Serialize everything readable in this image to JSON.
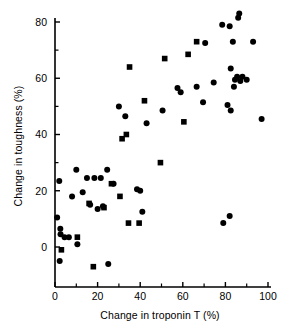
{
  "chart_data": {
    "type": "scatter",
    "title": "",
    "xlabel": "Change in troponin T (%)",
    "ylabel": "Change in toughness (%)",
    "xlim": [
      0,
      100
    ],
    "ylim": [
      -10,
      85
    ],
    "xticks": [
      0,
      20,
      40,
      60,
      80,
      100
    ],
    "yticks": [
      0,
      20,
      40,
      60,
      80
    ],
    "xtick_labels": [
      "0",
      "20",
      "40",
      "60",
      "80",
      "100"
    ],
    "ytick_labels": [
      "0",
      "20",
      "40",
      "60",
      "80"
    ],
    "minor_yticks": [
      10,
      30,
      50,
      70
    ],
    "minor_xticks": [
      10,
      30,
      50,
      70,
      90
    ],
    "grid": false,
    "legend": null,
    "marker_color": "#000000",
    "series": [
      {
        "name": "circles",
        "marker": "circle",
        "points": [
          [
            1.0,
            10.5
          ],
          [
            2.0,
            23.5
          ],
          [
            2.5,
            6.5
          ],
          [
            2.6,
            4.5
          ],
          [
            2.2,
            -5.0
          ],
          [
            4.5,
            3.5
          ],
          [
            6.5,
            3.5
          ],
          [
            8.0,
            18.0
          ],
          [
            10.5,
            1.0
          ],
          [
            10.0,
            27.5
          ],
          [
            13.0,
            19.5
          ],
          [
            15.0,
            24.5
          ],
          [
            16.5,
            15.0
          ],
          [
            18.5,
            24.5
          ],
          [
            20.0,
            13.5
          ],
          [
            21.5,
            24.5
          ],
          [
            22.5,
            14.5
          ],
          [
            24.5,
            27.5
          ],
          [
            25.0,
            -6.0
          ],
          [
            27.5,
            22.5
          ],
          [
            30.0,
            50.0
          ],
          [
            33.0,
            46.5
          ],
          [
            38.5,
            20.5
          ],
          [
            40.0,
            20.0
          ],
          [
            41.0,
            12.5
          ],
          [
            43.0,
            44.0
          ],
          [
            50.5,
            48.5
          ],
          [
            57.5,
            56.5
          ],
          [
            59.0,
            55.0
          ],
          [
            66.5,
            57.0
          ],
          [
            69.5,
            51.5
          ],
          [
            70.5,
            72.5
          ],
          [
            74.5,
            58.5
          ],
          [
            78.5,
            79.0
          ],
          [
            79.0,
            8.5
          ],
          [
            81.0,
            50.5
          ],
          [
            82.0,
            78.5
          ],
          [
            82.0,
            11.0
          ],
          [
            82.5,
            63.5
          ],
          [
            82.5,
            48.5
          ],
          [
            83.5,
            73.0
          ],
          [
            84.0,
            57.0
          ],
          [
            84.5,
            59.5
          ],
          [
            85.5,
            60.5
          ],
          [
            86.0,
            81.5
          ],
          [
            86.5,
            83.0
          ],
          [
            87.0,
            59.0
          ],
          [
            88.0,
            60.5
          ],
          [
            90.0,
            59.5
          ],
          [
            93.0,
            73.0
          ],
          [
            97.0,
            45.5
          ]
        ]
      },
      {
        "name": "squares",
        "marker": "square",
        "points": [
          [
            3.0,
            -1.0
          ],
          [
            10.5,
            3.5
          ],
          [
            16.0,
            15.5
          ],
          [
            18.0,
            -7.0
          ],
          [
            23.0,
            14.0
          ],
          [
            26.5,
            22.5
          ],
          [
            30.5,
            18.0
          ],
          [
            31.5,
            38.5
          ],
          [
            33.5,
            40.0
          ],
          [
            34.5,
            8.5
          ],
          [
            35.0,
            64.0
          ],
          [
            39.5,
            8.5
          ],
          [
            42.0,
            52.0
          ],
          [
            49.5,
            30.0
          ],
          [
            51.5,
            67.0
          ],
          [
            60.5,
            44.5
          ],
          [
            62.5,
            68.5
          ],
          [
            66.5,
            73.0
          ]
        ]
      }
    ]
  },
  "axes": {
    "x_axis_name": "x-axis",
    "y_axis_name": "y-axis"
  }
}
